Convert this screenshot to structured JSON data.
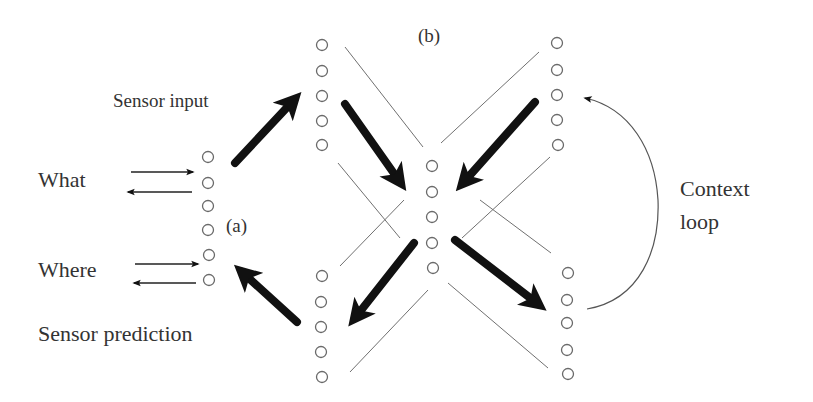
{
  "diagram": {
    "type": "neural-network-schematic",
    "labels": {
      "panel_a": "(a)",
      "panel_b": "(b)",
      "what": "What",
      "where": "Where",
      "sensor_input": "Sensor input",
      "sensor_prediction": "Sensor prediction",
      "context_line1": "Context",
      "context_line2": "loop"
    },
    "layers": [
      {
        "id": "a-interface",
        "nodes": 6
      },
      {
        "id": "b-top-left",
        "nodes": 5
      },
      {
        "id": "b-top-right",
        "nodes": 5
      },
      {
        "id": "b-center",
        "nodes": 5
      },
      {
        "id": "b-bottom-left",
        "nodes": 5
      },
      {
        "id": "b-bottom-right",
        "nodes": 5
      }
    ],
    "arrows": [
      {
        "from": "a-interface",
        "to": "b-top-left",
        "label": "Sensor input",
        "weight": "bold"
      },
      {
        "from": "b-top-left",
        "to": "b-center",
        "weight": "bold"
      },
      {
        "from": "b-top-right",
        "to": "b-center",
        "weight": "bold"
      },
      {
        "from": "b-center",
        "to": "b-bottom-left",
        "weight": "bold"
      },
      {
        "from": "b-center",
        "to": "b-bottom-right",
        "weight": "bold"
      },
      {
        "from": "b-bottom-left",
        "to": "a-interface",
        "label": "Sensor prediction",
        "weight": "bold"
      },
      {
        "from": "b-bottom-right",
        "to": "b-top-right",
        "label": "Context loop",
        "weight": "curved"
      },
      {
        "from": "What",
        "to": "a-interface",
        "direction": "bidirectional"
      },
      {
        "from": "Where",
        "to": "a-interface",
        "direction": "bidirectional"
      }
    ],
    "colors": {
      "background": "#ffffff",
      "text": "#333333",
      "node_stroke": "#6a6a6a",
      "arrow": "#111111"
    }
  }
}
